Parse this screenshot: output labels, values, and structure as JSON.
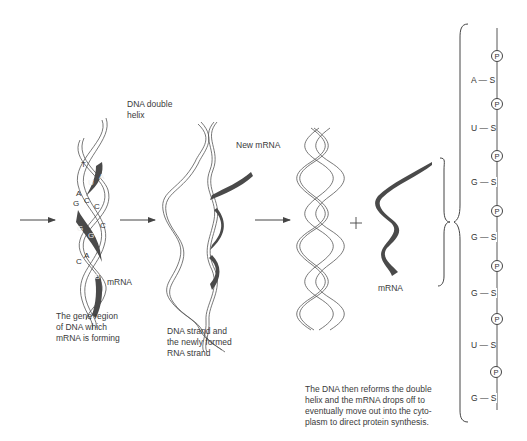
{
  "figure": {
    "labels": {
      "dna_double_helix_line1": "DNA double",
      "dna_double_helix_line2": "helix",
      "new_mrna": "New mRNA",
      "mrna_stage1": "mRNA",
      "mrna_stage3": "mRNA",
      "plus": "+"
    },
    "captions": {
      "stage1": [
        "The gene region",
        "of DNA which",
        "mRNA is forming"
      ],
      "stage2": [
        "DNA strand and",
        "the newly formed",
        "RNA strand"
      ],
      "stage3": [
        "The DNA then reforms the double",
        "helix and the mRNA drops off to",
        "eventually move out into the cyto-",
        "plasm to direct protein synthesis."
      ]
    },
    "stage1_bases": [
      {
        "letter": "T"
      },
      {
        "letter": "A"
      },
      {
        "letter": "U"
      },
      {
        "letter": "A"
      },
      {
        "letter": "G"
      },
      {
        "letter": "C"
      },
      {
        "letter": "C"
      },
      {
        "letter": "G"
      },
      {
        "letter": "C"
      },
      {
        "letter": "G"
      },
      {
        "letter": "C"
      },
      {
        "letter": "A"
      },
      {
        "letter": "G"
      }
    ],
    "mrna_chain": {
      "phosphate_symbol": "P",
      "sugar_symbol": "S",
      "bases": [
        "A",
        "U",
        "G",
        "G",
        "G",
        "U",
        "G"
      ]
    },
    "colors": {
      "line": "#444444",
      "mrna_fill": "#4a4a4a",
      "text": "#3a3a3a"
    }
  }
}
